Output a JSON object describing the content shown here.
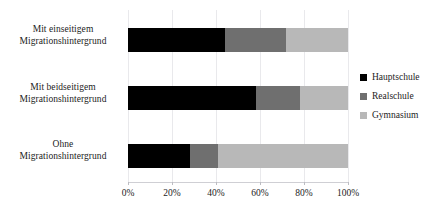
{
  "chart_data": {
    "type": "bar",
    "orientation": "horizontal",
    "stacked": true,
    "normalized_percent": true,
    "title": "",
    "subtitle": "",
    "xlabel": "",
    "ylabel": "",
    "xlim": [
      0,
      100
    ],
    "xticks": [
      0,
      20,
      40,
      60,
      80,
      100
    ],
    "xtick_labels": [
      "0%",
      "20%",
      "40%",
      "60%",
      "80%",
      "100%"
    ],
    "grid": true,
    "grid_axis": "x",
    "legend_position": "right",
    "categories": [
      "Mit einseitigem Migrationshintergrund",
      "Mit beidseitigem Migrationshintergrund",
      "Ohne Migrationshintergrund"
    ],
    "category_lines": [
      [
        "Mit einseitigem",
        "Migrationshintergrund"
      ],
      [
        "Mit beidseitigem",
        "Migrationshintergrund"
      ],
      [
        "Ohne",
        "Migrationshintergrund"
      ]
    ],
    "series": [
      {
        "name": "Hauptschule",
        "color": "#000000",
        "values": [
          44,
          58,
          28
        ]
      },
      {
        "name": "Realschule",
        "color": "#6f6f6f",
        "values": [
          28,
          20,
          13
        ]
      },
      {
        "name": "Gymnasium",
        "color": "#b8b8b8",
        "values": [
          28,
          22,
          59
        ]
      }
    ]
  },
  "legend": {
    "items": [
      {
        "label": "Hauptschule",
        "color": "#000000"
      },
      {
        "label": "Realschule",
        "color": "#6f6f6f"
      },
      {
        "label": "Gymnasium",
        "color": "#b8b8b8"
      }
    ]
  },
  "colors": {
    "background": "#ffffff",
    "text": "#1c1c1c",
    "gridline": "#e9e9ec",
    "axis": "#cfcfd4"
  }
}
